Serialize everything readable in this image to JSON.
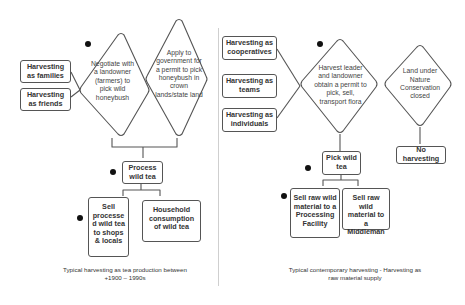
{
  "left_panel": {
    "harvester_groups": [
      "Harvesting as families",
      "Harvesting as friends"
    ],
    "decision_negotiate": "Negotiate with a landowner (farmers) to pick wild honeybush",
    "decision_apply": "Apply to government for a permit to pick honeybush in crown lands/state land",
    "process": "Process wild tea",
    "outcomes": [
      "Sell processe d wild tea to shops & locals",
      "Household consumption of wild tea"
    ],
    "caption_line1": "Typical harvesting as tea production between",
    "caption_line2": "+1900 – 1990s"
  },
  "right_panel": {
    "harvester_groups": [
      "Harvesting as cooperatives",
      "Harvesting as teams",
      "Harvesting as individuals"
    ],
    "decision_permit": "Harvest leader and landowner obtain a permit to pick, sell, transport flora",
    "decision_conservation": "Land under Nature Conservation closed",
    "pick": "Pick wild tea",
    "no_harvest": "No harvesting",
    "outcomes": [
      "Sell raw wild material to a Processing Facility",
      "Sell raw wild material to a Middleman"
    ],
    "caption_line1": "Typical contemporary harvesting - Harvesting as",
    "caption_line2": "raw material supply"
  },
  "colors": {
    "line": "#555555",
    "dot": "#111111",
    "divider": "#cfcfcf"
  }
}
